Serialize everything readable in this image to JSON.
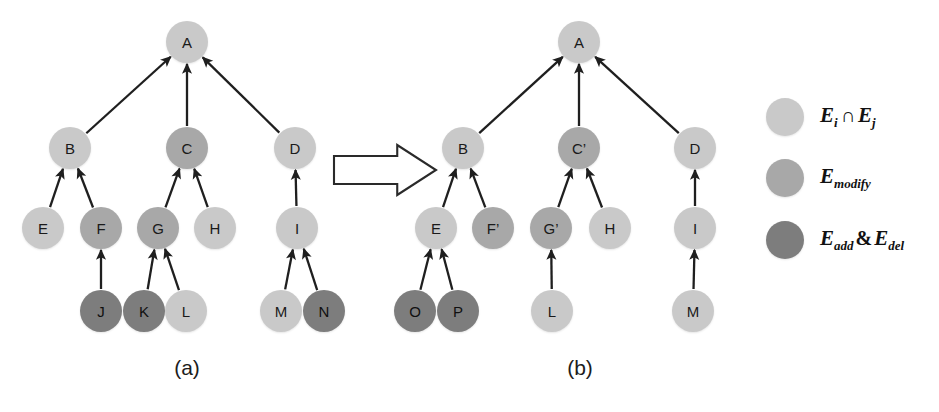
{
  "figure": {
    "width": 939,
    "height": 412,
    "background": "#ffffff"
  },
  "colors": {
    "intersection": "#c9c9c9",
    "modify": "#a8a8a8",
    "add_del": "#7d7d7d",
    "edge": "#1f1f1f",
    "text": "#1a1a1a",
    "arrow_outline": "#2a2a2a"
  },
  "panels": [
    {
      "id": "panel-a",
      "label": "(a)",
      "label_x": 187,
      "label_y": 368,
      "nodes": [
        {
          "id": "a-A",
          "label": "A",
          "x": 187,
          "y": 42,
          "r": 21,
          "kind": "intersection"
        },
        {
          "id": "a-B",
          "label": "B",
          "x": 70,
          "y": 148,
          "r": 21,
          "kind": "intersection"
        },
        {
          "id": "a-C",
          "label": "C",
          "x": 187,
          "y": 148,
          "r": 21,
          "kind": "modify"
        },
        {
          "id": "a-D",
          "label": "D",
          "x": 295,
          "y": 148,
          "r": 21,
          "kind": "intersection"
        },
        {
          "id": "a-E",
          "label": "E",
          "x": 43,
          "y": 228,
          "r": 21,
          "kind": "intersection"
        },
        {
          "id": "a-F",
          "label": "F",
          "x": 101,
          "y": 228,
          "r": 21,
          "kind": "modify"
        },
        {
          "id": "a-G",
          "label": "G",
          "x": 158,
          "y": 228,
          "r": 21,
          "kind": "modify"
        },
        {
          "id": "a-H",
          "label": "H",
          "x": 215,
          "y": 228,
          "r": 21,
          "kind": "intersection"
        },
        {
          "id": "a-I",
          "label": "I",
          "x": 297,
          "y": 228,
          "r": 21,
          "kind": "intersection"
        },
        {
          "id": "a-J",
          "label": "J",
          "x": 101,
          "y": 311,
          "r": 21,
          "kind": "add_del"
        },
        {
          "id": "a-K",
          "label": "K",
          "x": 144,
          "y": 311,
          "r": 21,
          "kind": "add_del"
        },
        {
          "id": "a-L",
          "label": "L",
          "x": 186,
          "y": 311,
          "r": 21,
          "kind": "intersection"
        },
        {
          "id": "a-M",
          "label": "M",
          "x": 281,
          "y": 311,
          "r": 21,
          "kind": "intersection"
        },
        {
          "id": "a-N",
          "label": "N",
          "x": 324,
          "y": 311,
          "r": 21,
          "kind": "add_del"
        }
      ],
      "edges": [
        {
          "from": "a-B",
          "to": "a-A"
        },
        {
          "from": "a-C",
          "to": "a-A"
        },
        {
          "from": "a-D",
          "to": "a-A"
        },
        {
          "from": "a-E",
          "to": "a-B"
        },
        {
          "from": "a-F",
          "to": "a-B"
        },
        {
          "from": "a-G",
          "to": "a-C"
        },
        {
          "from": "a-H",
          "to": "a-C"
        },
        {
          "from": "a-I",
          "to": "a-D"
        },
        {
          "from": "a-J",
          "to": "a-F"
        },
        {
          "from": "a-K",
          "to": "a-G"
        },
        {
          "from": "a-L",
          "to": "a-G"
        },
        {
          "from": "a-M",
          "to": "a-I"
        },
        {
          "from": "a-N",
          "to": "a-I"
        }
      ]
    },
    {
      "id": "panel-b",
      "label": "(b)",
      "label_x": 580,
      "label_y": 368,
      "nodes": [
        {
          "id": "b-A",
          "label": "A",
          "x": 579,
          "y": 42,
          "r": 21,
          "kind": "intersection"
        },
        {
          "id": "b-B",
          "label": "B",
          "x": 463,
          "y": 148,
          "r": 21,
          "kind": "intersection"
        },
        {
          "id": "b-C2",
          "label": "C’",
          "x": 579,
          "y": 148,
          "r": 21,
          "kind": "modify"
        },
        {
          "id": "b-D",
          "label": "D",
          "x": 695,
          "y": 148,
          "r": 21,
          "kind": "intersection"
        },
        {
          "id": "b-E",
          "label": "E",
          "x": 436,
          "y": 228,
          "r": 21,
          "kind": "intersection"
        },
        {
          "id": "b-F2",
          "label": "F’",
          "x": 493,
          "y": 228,
          "r": 21,
          "kind": "modify"
        },
        {
          "id": "b-G2",
          "label": "G’",
          "x": 551,
          "y": 228,
          "r": 21,
          "kind": "modify"
        },
        {
          "id": "b-H",
          "label": "H",
          "x": 610,
          "y": 228,
          "r": 21,
          "kind": "intersection"
        },
        {
          "id": "b-I",
          "label": "I",
          "x": 695,
          "y": 228,
          "r": 21,
          "kind": "intersection"
        },
        {
          "id": "b-O",
          "label": "O",
          "x": 415,
          "y": 311,
          "r": 21,
          "kind": "add_del"
        },
        {
          "id": "b-P",
          "label": "P",
          "x": 458,
          "y": 311,
          "r": 21,
          "kind": "add_del"
        },
        {
          "id": "b-L",
          "label": "L",
          "x": 552,
          "y": 311,
          "r": 21,
          "kind": "intersection"
        },
        {
          "id": "b-M",
          "label": "M",
          "x": 693,
          "y": 311,
          "r": 21,
          "kind": "intersection"
        }
      ],
      "edges": [
        {
          "from": "b-B",
          "to": "b-A"
        },
        {
          "from": "b-C2",
          "to": "b-A"
        },
        {
          "from": "b-D",
          "to": "b-A"
        },
        {
          "from": "b-E",
          "to": "b-B"
        },
        {
          "from": "b-F2",
          "to": "b-B"
        },
        {
          "from": "b-G2",
          "to": "b-C2"
        },
        {
          "from": "b-H",
          "to": "b-C2"
        },
        {
          "from": "b-I",
          "to": "b-D"
        },
        {
          "from": "b-O",
          "to": "b-E"
        },
        {
          "from": "b-P",
          "to": "b-E"
        },
        {
          "from": "b-L",
          "to": "b-G2"
        },
        {
          "from": "b-M",
          "to": "b-I"
        }
      ]
    }
  ],
  "transition_arrow": {
    "name": "transition-arrow",
    "x": 334,
    "y": 145,
    "width": 102,
    "height": 50,
    "direction": "right"
  },
  "legend": {
    "swatch_x": 785,
    "swatch_r": 19,
    "label_x": 820,
    "items": [
      {
        "id": "legend-intersection",
        "kind": "intersection",
        "y": 117,
        "base": "E",
        "sub": "i",
        "operator": "∩",
        "base2": "E",
        "sub2": "j",
        "plain": "E_i ∩ E_j"
      },
      {
        "id": "legend-modify",
        "kind": "modify",
        "y": 178,
        "base": "E",
        "sub": "modify",
        "operator": "",
        "base2": "",
        "sub2": "",
        "plain": "E_modify"
      },
      {
        "id": "legend-add-del",
        "kind": "add_del",
        "y": 240,
        "base": "E",
        "sub": "add",
        "operator": "&",
        "base2": "E",
        "sub2": "del",
        "plain": "E_add & E_del"
      }
    ]
  }
}
